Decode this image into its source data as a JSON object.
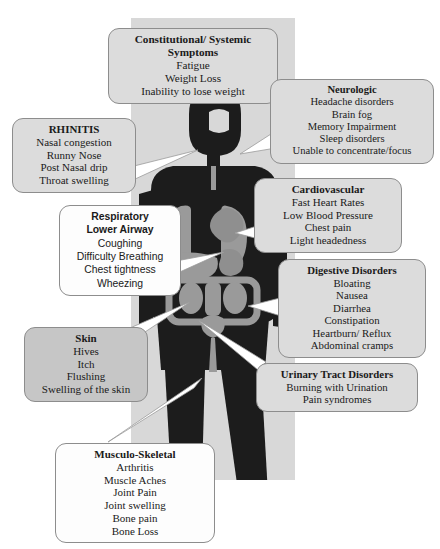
{
  "diagram": {
    "panel_color": "#d8d8d8",
    "figure_color": "#1c1c1c",
    "organ_color": "#9a9a9a"
  },
  "callouts": [
    {
      "id": "constitutional",
      "heading": [
        "Constitutional/ Systemic",
        "Symptoms"
      ],
      "items": [
        "Fatigue",
        "Weight Loss",
        "Inability to lose weight"
      ],
      "fill": "#dcdcdc"
    },
    {
      "id": "neurologic",
      "heading": [
        "Neurologic"
      ],
      "items": [
        "Headache disorders",
        "Brain fog",
        "Memory Impairment",
        "Sleep disorders",
        "Unable to concentrate/focus"
      ],
      "fill": "#dcdcdc"
    },
    {
      "id": "rhinitis",
      "heading": [
        "RHINITIS"
      ],
      "items": [
        "Nasal congestion",
        "Runny Nose",
        "Post Nasal drip",
        "Throat swelling"
      ],
      "fill": "#dcdcdc"
    },
    {
      "id": "cardiovascular",
      "heading": [
        "Cardiovascular"
      ],
      "items": [
        "Fast Heart Rates",
        "Low Blood Pressure",
        "Chest pain",
        "Light headedness"
      ],
      "fill": "#dcdcdc"
    },
    {
      "id": "respiratory",
      "heading": [
        "Respiratory",
        "Lower Airway"
      ],
      "items": [
        "Coughing",
        "Difficulty Breathing",
        "Chest tightness",
        "Wheezing"
      ],
      "fill": "#fdfdfd"
    },
    {
      "id": "digestive",
      "heading": [
        "Digestive Disorders"
      ],
      "items": [
        "Bloating",
        "Nausea",
        "Diarrhea",
        "Constipation",
        "Heartburn/ Reflux",
        "Abdominal cramps"
      ],
      "fill": "#dcdcdc"
    },
    {
      "id": "skin",
      "heading": [
        "Skin"
      ],
      "items": [
        "Hives",
        "Itch",
        "Flushing",
        "Swelling of the skin"
      ],
      "fill": "#c6c6c6"
    },
    {
      "id": "urinary",
      "heading": [
        "Urinary Tract Disorders"
      ],
      "items": [
        "Burning with Urination",
        "Pain syndromes"
      ],
      "fill": "#dcdcdc"
    },
    {
      "id": "musculoskeletal",
      "heading": [
        "Musculo-Skeletal"
      ],
      "items": [
        "Arthritis",
        "Muscle Aches",
        "Joint Pain",
        "Joint swelling",
        "Bone pain",
        "Bone Loss"
      ],
      "fill": "#fdfdfd"
    }
  ]
}
